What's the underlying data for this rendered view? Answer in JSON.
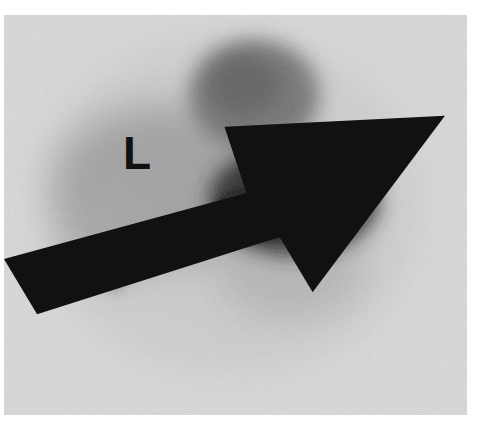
{
  "image": {
    "type": "scintigraphy-scan",
    "colors": {
      "page_background": "#ffffff",
      "frame_background": "#d9d9d9",
      "uptake_dark": "#0a0a0a",
      "uptake_mid": "#6e6e6e"
    }
  },
  "labels": {
    "liver": "L",
    "spleen": "S"
  },
  "annotations": {
    "arrow": "arrow-icon"
  }
}
